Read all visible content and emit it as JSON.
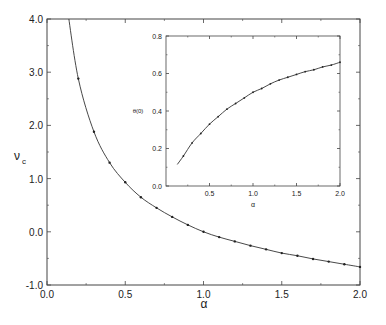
{
  "chart_data": [
    {
      "type": "line",
      "title": "",
      "xlabel": "α",
      "ylabel": "ν_c",
      "ylabel_main": "ν",
      "ylabel_sub": "c",
      "xlim": [
        0.0,
        2.0
      ],
      "ylim": [
        -1.0,
        4.0
      ],
      "xticks": [
        "0.0",
        "0.5",
        "1.0",
        "1.5",
        "2.0"
      ],
      "yticks": [
        "-1.0",
        "0.0",
        "1.0",
        "2.0",
        "3.0",
        "4.0"
      ],
      "grid": false,
      "curve_note": "solid line with point markers",
      "x": [
        0.2,
        0.3,
        0.4,
        0.5,
        0.6,
        0.7,
        0.8,
        0.9,
        1.0,
        1.1,
        1.2,
        1.3,
        1.4,
        1.5,
        1.6,
        1.7,
        1.8,
        1.9,
        2.0
      ],
      "values": [
        2.88,
        1.88,
        1.3,
        0.93,
        0.65,
        0.45,
        0.28,
        0.13,
        0.0,
        -0.1,
        -0.18,
        -0.26,
        -0.33,
        -0.4,
        -0.45,
        -0.51,
        -0.56,
        -0.61,
        -0.66
      ]
    },
    {
      "type": "line",
      "title": "",
      "xlabel": "α",
      "ylabel": "θ(0)",
      "xlim": [
        0.0,
        2.0
      ],
      "ylim": [
        0.0,
        0.8
      ],
      "xticks": [
        "0.5",
        "1.0",
        "1.5",
        "2.0"
      ],
      "yticks": [
        "0.0",
        "0.2",
        "0.4",
        "0.6",
        "0.8"
      ],
      "grid": false,
      "x": [
        0.2,
        0.3,
        0.4,
        0.5,
        0.6,
        0.7,
        0.8,
        0.9,
        1.0,
        1.1,
        1.2,
        1.3,
        1.4,
        1.5,
        1.6,
        1.7,
        1.8,
        1.9,
        2.0
      ],
      "values": [
        0.16,
        0.23,
        0.28,
        0.33,
        0.37,
        0.41,
        0.44,
        0.47,
        0.5,
        0.52,
        0.545,
        0.565,
        0.58,
        0.595,
        0.61,
        0.62,
        0.635,
        0.645,
        0.66
      ]
    }
  ]
}
